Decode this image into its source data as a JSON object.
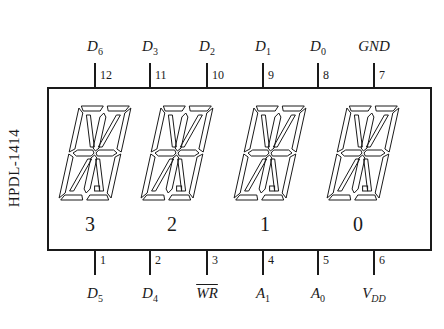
{
  "part_number": "HPDL-1414",
  "top_pins": [
    {
      "pin": "12",
      "signal": "D",
      "sub": "6",
      "x": 95
    },
    {
      "pin": "11",
      "signal": "D",
      "sub": "3",
      "x": 150
    },
    {
      "pin": "10",
      "signal": "D",
      "sub": "2",
      "x": 207
    },
    {
      "pin": "9",
      "signal": "D",
      "sub": "1",
      "x": 263
    },
    {
      "pin": "8",
      "signal": "D",
      "sub": "0",
      "x": 318
    },
    {
      "pin": "7",
      "signal": "GND",
      "sub": "",
      "x": 374
    }
  ],
  "bottom_pins": [
    {
      "pin": "1",
      "signal": "D",
      "sub": "5",
      "x": 95
    },
    {
      "pin": "2",
      "signal": "D",
      "sub": "4",
      "x": 150
    },
    {
      "pin": "3",
      "signal": "WR",
      "sub": "",
      "overline": true,
      "x": 207
    },
    {
      "pin": "4",
      "signal": "A",
      "sub": "1",
      "x": 263
    },
    {
      "pin": "5",
      "signal": "A",
      "sub": "0",
      "x": 318
    },
    {
      "pin": "6",
      "signal": "V",
      "sub": "DD",
      "x": 374
    }
  ],
  "digits": [
    {
      "label": "3",
      "cx": 95
    },
    {
      "label": "2",
      "cx": 177
    },
    {
      "label": "1",
      "cx": 270
    },
    {
      "label": "0",
      "cx": 363
    }
  ],
  "colors": {
    "line": "#1a1a1a",
    "background": "#ffffff"
  }
}
